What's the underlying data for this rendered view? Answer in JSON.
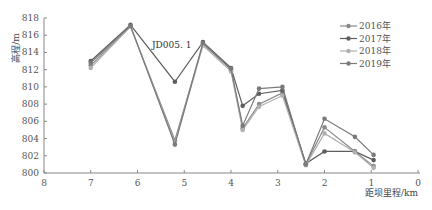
{
  "chart_data": {
    "type": "line",
    "title": "",
    "xlabel": "距坝里程/km",
    "ylabel": "高程/m",
    "xlim": [
      8,
      0
    ],
    "ylim": [
      800,
      818
    ],
    "x_reversed": true,
    "xticks": [
      "8",
      "7",
      "6",
      "5",
      "4",
      "3",
      "2",
      "1",
      "0"
    ],
    "yticks": [
      "800",
      "802",
      "804",
      "806",
      "808",
      "810",
      "812",
      "814",
      "816",
      "818"
    ],
    "grid": false,
    "legend_position": "upper right",
    "annotations": [
      {
        "text": "JD005. 1",
        "x": 5.5,
        "y": 813.8
      }
    ],
    "x": [
      7.0,
      6.15,
      5.2,
      4.6,
      4.0,
      3.75,
      3.4,
      2.9,
      2.4,
      2.0,
      1.35,
      0.95
    ],
    "series": [
      {
        "name": "2016年",
        "color": "#8a8a8a",
        "values": [
          812.5,
          817.0,
          803.8,
          815.0,
          812.0,
          805.2,
          808.0,
          809.3,
          801.0,
          805.3,
          802.5,
          800.8
        ]
      },
      {
        "name": "2017年",
        "color": "#5e5e5e",
        "values": [
          813.0,
          817.2,
          810.6,
          815.2,
          812.2,
          807.8,
          809.2,
          809.6,
          801.1,
          802.5,
          802.5,
          801.5
        ]
      },
      {
        "name": "2018年",
        "color": "#b0b0b0",
        "values": [
          812.2,
          817.0,
          803.5,
          814.8,
          811.8,
          805.0,
          807.7,
          809.0,
          800.9,
          804.6,
          802.4,
          800.6
        ]
      },
      {
        "name": "2019年",
        "color": "#7a7a7a",
        "values": [
          812.8,
          817.1,
          803.3,
          815.1,
          812.1,
          805.5,
          809.8,
          810.0,
          801.0,
          806.3,
          804.2,
          802.1
        ]
      }
    ]
  }
}
